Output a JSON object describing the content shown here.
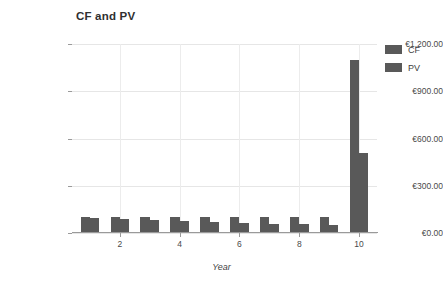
{
  "chart_data": {
    "type": "bar",
    "title": "CF and PV",
    "xlabel": "Year",
    "ylabel": "",
    "categories": [
      1,
      2,
      3,
      4,
      5,
      6,
      7,
      8,
      9,
      10
    ],
    "series": [
      {
        "name": "CF",
        "values": [
          100,
          100,
          100,
          100,
          100,
          100,
          100,
          100,
          100,
          1100
        ],
        "color": "#595959"
      },
      {
        "name": "PV",
        "values": [
          95,
          87,
          81,
          75,
          70,
          64,
          60,
          56,
          52,
          510
        ],
        "color": "#595959"
      }
    ],
    "ylim": [
      0,
      1200
    ],
    "yticks": [
      0,
      300,
      600,
      900,
      1200
    ],
    "ytick_labels": [
      "€0.00",
      "€300.00",
      "€600.00",
      "€900.00",
      "€1,200.00"
    ],
    "xticks": [
      2,
      4,
      6,
      8,
      10
    ],
    "xtick_labels": [
      "2",
      "4",
      "6",
      "8",
      "10"
    ],
    "xlim": [
      0.4,
      10.6
    ],
    "grid": true,
    "legend_position": "right-top",
    "legend_entries": [
      "CF",
      "PV"
    ]
  },
  "axis": {
    "x_title": "Year"
  }
}
